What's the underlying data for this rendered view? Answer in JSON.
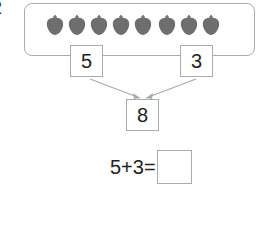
{
  "question_number": "2",
  "fruits": {
    "group_left_count": 5,
    "group_right_count": 3,
    "icon": "strawberry-icon",
    "color": "#6e6e6e"
  },
  "part_left": "5",
  "part_right": "3",
  "whole": "8",
  "equation": {
    "expression": "5+3=",
    "answer": ""
  }
}
